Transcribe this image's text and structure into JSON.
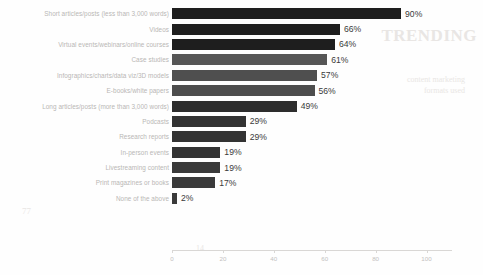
{
  "chart_data": {
    "type": "bar",
    "orientation": "horizontal",
    "title": "",
    "xlabel": "",
    "ylabel": "",
    "xlim": [
      0,
      110
    ],
    "grid": false,
    "legend": null,
    "value_suffix": "%",
    "axis_ticks": [
      0,
      20,
      40,
      60,
      80,
      100
    ],
    "categories": [
      "Short articles/posts (less than 3,000 words)",
      "Videos",
      "Virtual events/webinars/online courses",
      "Case studies",
      "Infographics/charts/data viz/3D models",
      "E-books/white papers",
      "Long articles/posts (more than 3,000 words)",
      "Podcasts",
      "Research reports",
      "In-person events",
      "Livestreaming content",
      "Print magazines or books",
      "None of the above"
    ],
    "values": [
      90,
      66,
      64,
      61,
      57,
      56,
      49,
      29,
      29,
      19,
      19,
      17,
      2
    ],
    "value_labels": [
      "90%",
      "66%",
      "64%",
      "61%",
      "57%",
      "56%",
      "49%",
      "29%",
      "29%",
      "19%",
      "19%",
      "17%",
      "2%"
    ],
    "bar_colors": [
      "#1e1e1e",
      "#1e1e1e",
      "#1e1e1e",
      "#565656",
      "#4f4f4f",
      "#4d4d4d",
      "#2d2d2d",
      "#333333",
      "#333333",
      "#333333",
      "#3a3a3a",
      "#3a3a3a",
      "#3a3a3a"
    ]
  },
  "style": {
    "label_color": "#b9b7b5",
    "value_color": "#3a3a3a",
    "axis_color": "#d9d7d5",
    "tick_label_color": "#c3c1bf",
    "background": "#fefefe"
  },
  "background_artifacts": {
    "headline": "TRENDING",
    "block_a_line1": "content marketing",
    "block_a_line2": "formats used",
    "mark_left": "77",
    "mark_mid": "14"
  }
}
